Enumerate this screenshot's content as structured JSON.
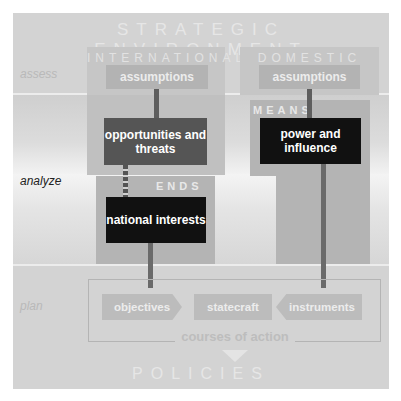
{
  "diagram": {
    "title": "STRATEGIC ENVIRONMENT",
    "rows": {
      "assess": "assess",
      "analyze": "analyze",
      "plan": "plan"
    },
    "columns": {
      "international": {
        "heading": "INTERNATIONAL",
        "assumptions": "assumptions",
        "opportunities": "opportunities and threats",
        "ends_label": "ENDS",
        "national_interests": "national interests"
      },
      "domestic": {
        "heading": "DOMESTIC",
        "assumptions": "assumptions",
        "means_label": "MEANS",
        "power": "power and influence"
      }
    },
    "plan": {
      "objectives": "objectives",
      "statecraft": "statecraft",
      "instruments": "instruments",
      "courses_of_action": "courses of action"
    },
    "output": "POLICIES",
    "colors": {
      "background": "#d3d3d3",
      "dark_box": "#111111",
      "mid_box": "#555555",
      "region": "#b4b4b4",
      "stem": "#5e5e5e"
    }
  }
}
